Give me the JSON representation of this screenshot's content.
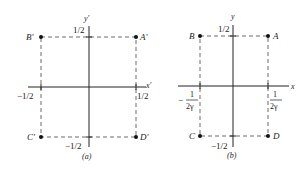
{
  "panels": [
    {
      "id": "a",
      "caption": "(a)",
      "axis_x": "x'",
      "axis_y": "y'",
      "corners": {
        "top_left": "B'",
        "top_right": "A'",
        "bottom_left": "C'",
        "bottom_right": "D'"
      },
      "ticks": {
        "top": "1/2",
        "bottom": "−1/2",
        "left": "−1/2",
        "right": "1/2"
      }
    },
    {
      "id": "b",
      "caption": "(b)",
      "axis_x": "x",
      "axis_y": "y",
      "corners": {
        "top_left": "B",
        "top_right": "A",
        "bottom_left": "C",
        "bottom_right": "D"
      },
      "ticks": {
        "top": "1/2",
        "bottom": "−1/2",
        "left_num": "1",
        "left_den": "2γ",
        "left_sign": "−",
        "right_num": "1",
        "right_den": "2γ"
      }
    }
  ],
  "colors": {
    "ink": "#222222",
    "background": "#ffffff"
  }
}
